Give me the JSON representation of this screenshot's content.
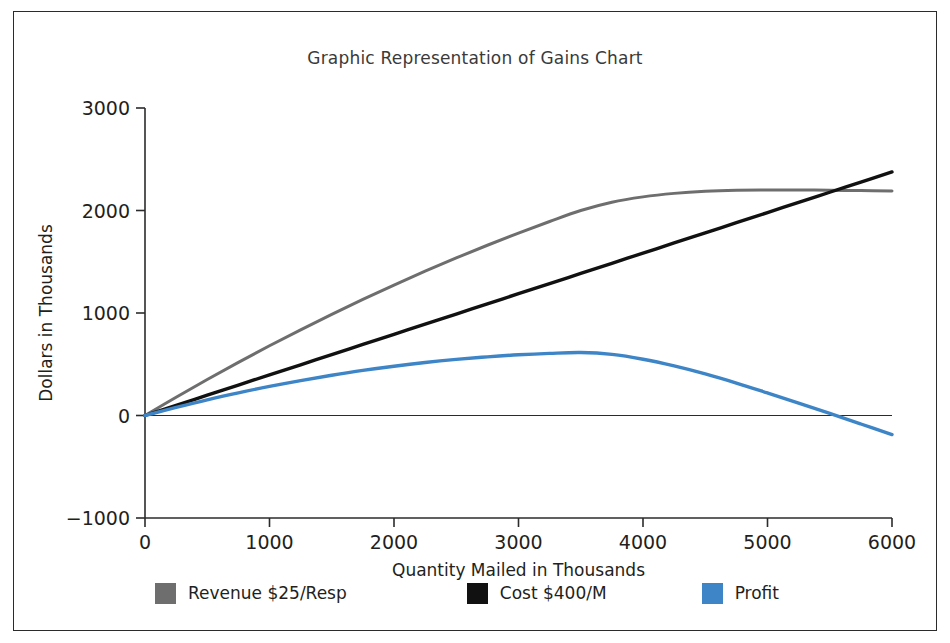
{
  "chart_data": {
    "type": "line",
    "title": "Graphic Representation of Gains Chart",
    "xlabel": "Quantity Mailed in Thousands",
    "ylabel": "Dollars in Thousands",
    "xlim": [
      0,
      6000
    ],
    "ylim": [
      -1000,
      3000
    ],
    "xticks": [
      0,
      1000,
      2000,
      3000,
      4000,
      5000,
      6000
    ],
    "yticks": [
      -1000,
      0,
      1000,
      2000,
      3000
    ],
    "xtick_labels": [
      "0",
      "1000",
      "2000",
      "3000",
      "4000",
      "5000",
      "6000"
    ],
    "ytick_labels": [
      "−1000",
      "0",
      "1000",
      "2000",
      "3000"
    ],
    "grid": false,
    "legend_position": "bottom",
    "zero_line": true,
    "x": [
      0,
      250,
      500,
      750,
      1000,
      1250,
      1500,
      1750,
      2000,
      2250,
      2500,
      2750,
      3000,
      3250,
      3500,
      3750,
      4000,
      4250,
      4500,
      4750,
      5000,
      5250,
      5500,
      5750,
      6000
    ],
    "series": [
      {
        "name": "Revenue $25/Resp",
        "color": "#6e6e6e",
        "values": [
          0,
          178,
          351,
          518,
          680,
          836,
          987,
          1133,
          1273,
          1408,
          1537,
          1661,
          1780,
          1893,
          2000,
          2081,
          2133,
          2167,
          2188,
          2198,
          2200,
          2200,
          2198,
          2194,
          2190
        ]
      },
      {
        "name": "Cost $400/M",
        "color": "#111111",
        "values": [
          0,
          99,
          198,
          297,
          396,
          495,
          594,
          693,
          792,
          891,
          990,
          1089,
          1188,
          1287,
          1386,
          1485,
          1584,
          1683,
          1782,
          1881,
          1980,
          2079,
          2178,
          2277,
          2376
        ]
      },
      {
        "name": "Profit",
        "color": "#3d85c6",
        "values": [
          0,
          79,
          153,
          221,
          284,
          341,
          393,
          440,
          481,
          517,
          547,
          572,
          592,
          606,
          614,
          596,
          549,
          484,
          406,
          317,
          220,
          121,
          20,
          -83,
          -186
        ]
      }
    ]
  },
  "legend": {
    "items": [
      {
        "label": "Revenue $25/Resp",
        "color": "#6e6e6e"
      },
      {
        "label": "Cost $400/M",
        "color": "#111111"
      },
      {
        "label": "Profit",
        "color": "#3d85c6"
      }
    ]
  }
}
